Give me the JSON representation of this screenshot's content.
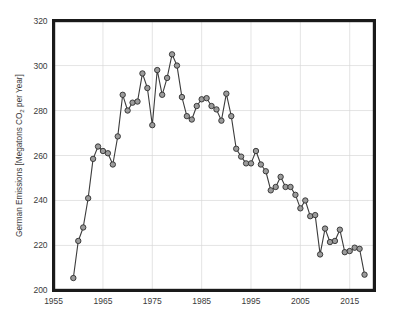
{
  "chart_data": {
    "type": "line",
    "title": "",
    "subtitle": "",
    "xlabel": "",
    "ylabel": "German Emissions [Megatons CO2 per Year]",
    "ylabel_parts": {
      "before": "German Emissions [Megatons CO",
      "subscript": "2",
      "after": " per Year]"
    },
    "xlim": [
      1955,
      2020
    ],
    "ylim": [
      200,
      320
    ],
    "xticks": [
      1955,
      1965,
      1975,
      1985,
      1995,
      2005,
      2015
    ],
    "yticks": [
      200,
      220,
      240,
      260,
      280,
      300,
      320
    ],
    "xtick_labels": [
      "1955",
      "1965",
      "1975",
      "1985",
      "1995",
      "2005",
      "2015"
    ],
    "ytick_labels": [
      "200",
      "220",
      "240",
      "260",
      "280",
      "300",
      "320"
    ],
    "grid": true,
    "grid_color": "#d9d9d9",
    "legend": false,
    "legend_position": "none",
    "marker": "circle",
    "marker_face_color": "#9b9b9b",
    "marker_edge_color": "#2e2e2e",
    "line_color": "#3c3c3c",
    "frame_color": "#1a1a1a",
    "background_color": "#ffffff",
    "series": [
      {
        "name": "German CO2 Emissions",
        "x": [
          1959,
          1960,
          1961,
          1962,
          1963,
          1964,
          1965,
          1966,
          1967,
          1968,
          1969,
          1970,
          1971,
          1972,
          1973,
          1974,
          1975,
          1976,
          1977,
          1978,
          1979,
          1980,
          1981,
          1982,
          1983,
          1984,
          1985,
          1986,
          1987,
          1988,
          1989,
          1990,
          1991,
          1992,
          1993,
          1994,
          1995,
          1996,
          1997,
          1998,
          1999,
          2000,
          2001,
          2002,
          2003,
          2004,
          2005,
          2006,
          2007,
          2008,
          2009,
          2010,
          2011,
          2012,
          2013,
          2014,
          2015,
          2016,
          2017,
          2018
        ],
        "values": [
          205.5,
          222.0,
          228.0,
          241.0,
          258.5,
          264.0,
          262.0,
          261.0,
          256.0,
          268.5,
          287.0,
          280.0,
          283.5,
          284.0,
          296.5,
          290.0,
          273.5,
          298.0,
          287.0,
          294.5,
          305.0,
          300.0,
          286.0,
          277.5,
          276.0,
          282.0,
          285.0,
          285.5,
          282.0,
          280.5,
          275.5,
          287.5,
          277.5,
          263.0,
          259.5,
          256.5,
          256.5,
          262.0,
          256.0,
          253.0,
          244.5,
          246.0,
          250.5,
          246.0,
          246.0,
          242.5,
          236.5,
          240.0,
          233.0,
          233.5,
          216.0,
          227.5,
          221.5,
          222.0,
          227.0,
          217.0,
          217.5,
          219.0,
          218.5,
          207.0
        ]
      }
    ]
  }
}
